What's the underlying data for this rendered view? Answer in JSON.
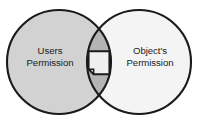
{
  "diagram": {
    "type": "venn-diagram",
    "background_color": "#ffffff",
    "stroke_color": "#1a1a1a",
    "left_circle": {
      "label_line1": "Users",
      "label_line2": "Permission",
      "fill_color": "#d2d2d2",
      "cx": 59,
      "cy": 62,
      "r": 52
    },
    "right_circle": {
      "label_line1": "Object's",
      "label_line2": "Permission",
      "fill_color": "#f4f4f4",
      "cx": 139,
      "cy": 62,
      "r": 52
    },
    "intersection": {
      "fill_color": "#b4b4b4",
      "icon": "document-page-icon",
      "icon_fill_color": "#f0f0f0",
      "icon_stroke_color": "#1a1a1a"
    }
  }
}
